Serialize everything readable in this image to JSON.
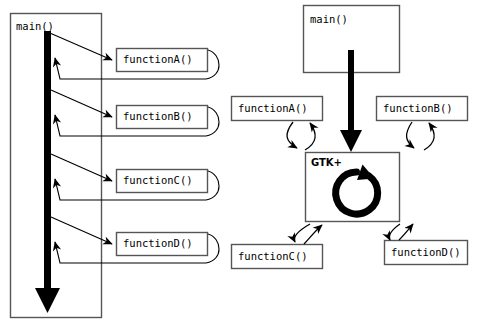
{
  "diagram": {
    "type": "control-flow-comparison",
    "stroke_color": "#000000",
    "box_border_color": "#555555",
    "box_fill_color": "#ffffff",
    "background_color": "#ffffff"
  },
  "left_panel": {
    "name": "procedural-flow",
    "container": {
      "label": "main()",
      "x": 10,
      "y": 13,
      "w": 92,
      "h": 305
    },
    "flow_bar": {
      "name": "main-execution-bar",
      "x": 44,
      "y": 31,
      "w": 7,
      "length": 279,
      "direction": "downward"
    },
    "calls": [
      {
        "label": "functionA()",
        "x": 116,
        "y": 48,
        "w": 92,
        "h": 24
      },
      {
        "label": "functionB()",
        "x": 116,
        "y": 105,
        "w": 92,
        "h": 24
      },
      {
        "label": "functionC()",
        "x": 116,
        "y": 169,
        "w": 92,
        "h": 24
      },
      {
        "label": "functionD()",
        "x": 116,
        "y": 232,
        "w": 92,
        "h": 24
      }
    ]
  },
  "right_panel": {
    "name": "gtk-event-driven-flow",
    "main_box": {
      "label": "main()",
      "x": 303,
      "y": 5,
      "w": 97,
      "h": 68
    },
    "gtk_box": {
      "label": "GTK+",
      "x": 305,
      "y": 152,
      "w": 95,
      "h": 70,
      "loop_icon": "circular-arrow-icon"
    },
    "callbacks": [
      {
        "label": "functionA()",
        "x": 231,
        "y": 96,
        "w": 92,
        "h": 25,
        "position": "top-left"
      },
      {
        "label": "functionB()",
        "x": 376,
        "y": 96,
        "w": 92,
        "h": 25,
        "position": "top-right"
      },
      {
        "label": "functionC()",
        "x": 231,
        "y": 244,
        "w": 92,
        "h": 25,
        "position": "bottom-left"
      },
      {
        "label": "functionD()",
        "x": 384,
        "y": 240,
        "w": 84,
        "h": 25,
        "position": "bottom-right"
      }
    ],
    "main_to_gtk": {
      "name": "main-to-gtk-arrow",
      "description": "thick downward arrow from main() into GTK+ box"
    }
  }
}
